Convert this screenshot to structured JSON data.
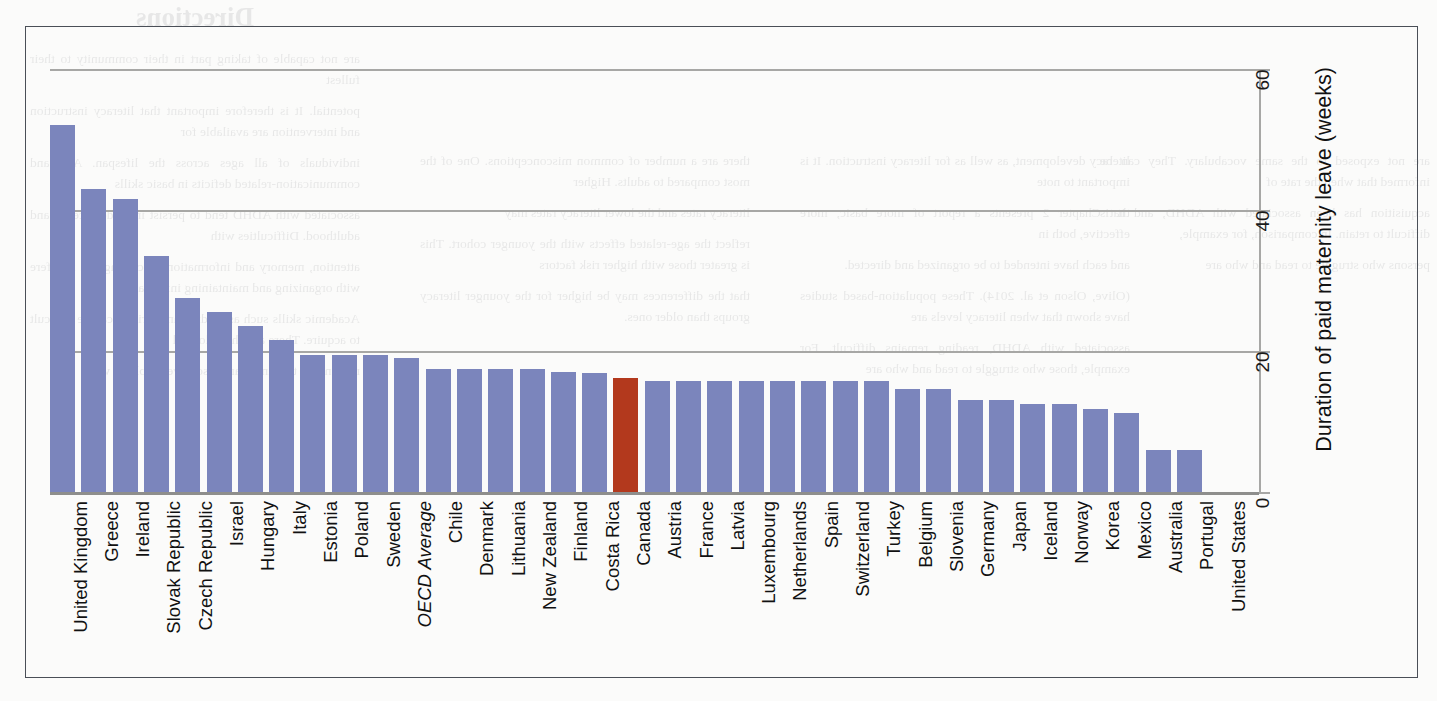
{
  "figure": {
    "frame": true,
    "blue": "#7b85bc",
    "highlight": "#b3391d",
    "gridline_color": "#a7a7a5"
  },
  "chart_data": {
    "type": "bar",
    "title": "",
    "xlabel": "",
    "ylabel": "Duration of paid maternity leave (weeks)",
    "ylim": [
      0,
      60
    ],
    "yticks": [
      0,
      20,
      40,
      60
    ],
    "grid": true,
    "legend": "none",
    "orientation": "vertical",
    "highlight_category": "Canada",
    "categories": [
      "United Kingdom",
      "Greece",
      "Ireland",
      "Slovak Republic",
      "Czech Republic",
      "Israel",
      "Hungary",
      "Italy",
      "Estonia",
      "Poland",
      "Sweden",
      "OECD Average",
      "Chile",
      "Denmark",
      "Lithuania",
      "New Zealand",
      "Finland",
      "Costa Rica",
      "Canada",
      "Austria",
      "France",
      "Latvia",
      "Luxembourg",
      "Netherlands",
      "Spain",
      "Switzerland",
      "Turkey",
      "Belgium",
      "Slovenia",
      "Germany",
      "Japan",
      "Iceland",
      "Norway",
      "Korea",
      "Mexico",
      "Australia",
      "Portugal",
      "United States"
    ],
    "values": [
      52,
      43,
      41.5,
      33.5,
      27.5,
      25.5,
      23.5,
      21.5,
      19.5,
      19.5,
      19.5,
      19,
      17.5,
      17.5,
      17.5,
      17.5,
      17,
      16.9,
      16.2,
      15.8,
      15.8,
      15.8,
      15.8,
      15.8,
      15.8,
      15.8,
      15.8,
      14.6,
      14.6,
      13,
      13,
      12.5,
      12.5,
      11.8,
      11.2,
      6,
      6,
      0
    ],
    "italic_categories": [
      "OECD Average"
    ]
  },
  "bleed_text": {
    "heading": "Directions",
    "col1": [
      "are not capable of taking part in their community to their fullest",
      "potential. It is therefore important that literacy instruction and intervention are available for",
      "individuals of all ages across the lifespan. Age and communication-related deficits in basic skills",
      "associated with ADHD tend to persist into adolescence and adulthood. Difficulties with",
      "attention, memory and information processing can interfere with organizing and maintaining information.",
      "Academic skills such as reading and writing can be difficult to acquire. There are physiological",
      "reasons for this and many also have problems with"
    ],
    "col2": [
      "there are a number of common misconceptions. One of the most compared to adults. Higher",
      "literacy rates and the lower literacy rates may",
      "reflect the age-related effects with the younger cohort. This is greater those with higher risk factors",
      "that the differences may be higher for the younger literacy groups than older ones."
    ],
    "col3": [
      "literacy development, as well as for literacy instruction. It is important to note",
      "that Chapter 2 presents a report of more basic, more effective, both in",
      "and each have intended to be organized and directed.",
      "(Olive, Olson et al. 2014). These population-based studies have shown that when literacy levels are",
      "associated with ADHD, reading remains difficult. For example, those who struggle to read and who are"
    ],
    "col4": [
      "are not exposed to the same vocabulary. They can be informed that when the rate of",
      "acquisition has been associated with ADHD, and it is difficult to retain. In comparison, for example,",
      "persons who struggle to read and who are"
    ]
  }
}
